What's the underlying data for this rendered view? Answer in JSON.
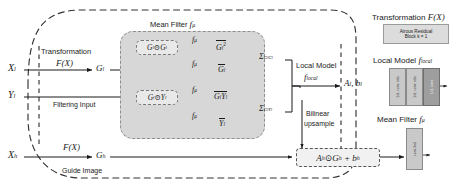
{
  "figure": {
    "type": "architecture-diagram",
    "title_mean_filter": "Mean Filter",
    "title_mean_filter_sym": "fμ"
  },
  "inputs": {
    "x_low": "Xₗ",
    "y_low": "Yₗ",
    "x_high": "Xₕ",
    "transformation_label": "Transformation",
    "transformation_fn": "F(X)",
    "filtering_input_label": "Filtering Input",
    "guide_image_label": "Guide Image",
    "g_low": "Gₗ",
    "g_high": "Gₕ"
  },
  "mean_filter": {
    "header": "Mean Filter fμ",
    "ops": [
      {
        "name": "g-corr",
        "expr": "Gₗ⊙Gₗ",
        "filter": "fμ",
        "out": "Gₗ² (bar)"
      },
      {
        "name": "g-mean",
        "expr": "",
        "filter": "fμ",
        "out": "G̅ₗ"
      },
      {
        "name": "gy-corr",
        "expr": "Gₗ⊙Yₗ",
        "filter": "fμ",
        "out": "GₗYₗ (bar)"
      },
      {
        "name": "y-mean",
        "expr": "",
        "filter": "fμ",
        "out": "Y̅ₗ"
      }
    ],
    "sigma_gg": "Σ",
    "sigma_gg_sub": "GₗGₗ",
    "sigma_gy": "Σ",
    "sigma_gy_sub": "GₗYₗ"
  },
  "local_model": {
    "label": "Local Model",
    "symbol": "fₗₒсₐₗ",
    "symbol_plain": "flocal",
    "outputs": "Aₗ, bₗ"
  },
  "upsample": {
    "line1": "Bilinear",
    "line2": "upsample"
  },
  "output": {
    "expr": "Aₕ⊙Gₕ + bₕ",
    "y_high": "Yₕ"
  },
  "right_panel": {
    "transformation": {
      "title_text": "Transformation",
      "title_sym": "F(X)",
      "block_line1": "Atrous Residual",
      "block_line2": "Block k = 1"
    },
    "local_model": {
      "title_text": "Local Model",
      "title_sym": "flocal",
      "bars": [
        {
          "label": "1x1 conv, relu",
          "style": "light"
        },
        {
          "label": "1x1 conv, relu",
          "style": "light"
        },
        {
          "label": "1x1 conv",
          "style": "dark"
        }
      ]
    },
    "mean_filter": {
      "title_text": "Mean Filter",
      "title_sym": "fμ",
      "bars": [
        {
          "label": "conv 3x3",
          "style": "light"
        }
      ]
    }
  },
  "colors": {
    "mean_filter_fill": "#d7d7d7",
    "op_fill": "#e9e9e9",
    "block_fill": "#dcdcdc",
    "bar_light": "#c9c9c9",
    "bar_dark": "#9e9e9e",
    "stroke": "#1a1a1a",
    "dashed_stroke": "#333333"
  }
}
